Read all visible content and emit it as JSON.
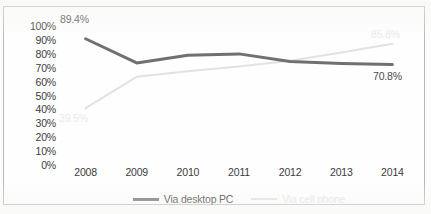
{
  "chart_data": {
    "type": "line",
    "title": "",
    "xlabel": "",
    "ylabel": "",
    "categories": [
      "2008",
      "2009",
      "2010",
      "2011",
      "2012",
      "2013",
      "2014"
    ],
    "ylim": [
      0,
      100
    ],
    "ytick_labels": [
      "100%",
      "90%",
      "80%",
      "70%",
      "60%",
      "50%",
      "40%",
      "30%",
      "20%",
      "10%",
      "0%"
    ],
    "ytick_values": [
      100,
      90,
      80,
      70,
      60,
      50,
      40,
      30,
      20,
      10,
      0
    ],
    "grid": false,
    "legend_position": "bottom",
    "series": [
      {
        "name": "Via desktop PC",
        "color": "#707070",
        "values": [
          89.4,
          72.0,
          77.5,
          78.5,
          73.0,
          71.5,
          70.8
        ]
      },
      {
        "name": "Via cell phone",
        "color": "#e2e2e2",
        "values": [
          39.5,
          62.0,
          66.0,
          69.5,
          73.5,
          79.5,
          85.8
        ]
      }
    ],
    "annotations": [
      {
        "text": "89.4%",
        "series": "Via desktop PC",
        "category": "2008",
        "value": 89.4,
        "style": "dark"
      },
      {
        "text": "39.5%",
        "series": "Via cell phone",
        "category": "2008",
        "value": 39.5,
        "style": "light"
      },
      {
        "text": "85.8%",
        "series": "Via cell phone",
        "category": "2014",
        "value": 85.8,
        "style": "light"
      },
      {
        "text": "70.8%",
        "series": "Via desktop PC",
        "category": "2014",
        "value": 70.8,
        "style": "dark"
      }
    ]
  },
  "axis": {
    "y": {
      "ticks": [
        "100%",
        "90%",
        "80%",
        "70%",
        "60%",
        "50%",
        "40%",
        "30%",
        "20%",
        "10%",
        "0%"
      ]
    },
    "x": {
      "ticks": [
        "2008",
        "2009",
        "2010",
        "2011",
        "2012",
        "2013",
        "2014"
      ]
    }
  },
  "legend": {
    "items": [
      {
        "label": "Via desktop PC"
      },
      {
        "label": "Via cell phone"
      }
    ]
  },
  "labels": {
    "desktop_start": "89.4%",
    "cell_start": "39.5%",
    "cell_end": "85.8%",
    "desktop_end": "70.8%"
  }
}
